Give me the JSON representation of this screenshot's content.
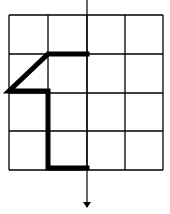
{
  "figure": {
    "type": "grid-path-diagram",
    "grid": {
      "rows": 4,
      "cols": 4,
      "x_lines": [
        9,
        48,
        87,
        125,
        163
      ],
      "y_lines": [
        15,
        54,
        93,
        131,
        170
      ],
      "line_color": "#000000"
    },
    "axis": {
      "x": 87,
      "y_start": 0,
      "y_end": 208,
      "arrow": "down"
    },
    "path": {
      "points": [
        [
          87,
          54
        ],
        [
          48,
          54
        ],
        [
          9,
          91
        ],
        [
          48,
          91
        ],
        [
          48,
          168
        ],
        [
          87,
          168
        ]
      ],
      "stroke_color": "#000000",
      "stroke_width": 5
    }
  }
}
